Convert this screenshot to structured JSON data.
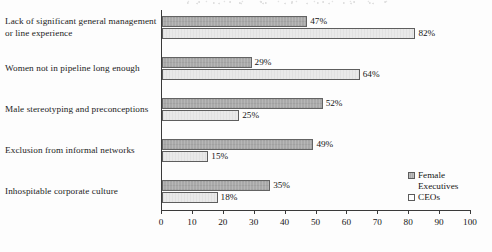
{
  "chart_data": {
    "type": "bar",
    "orientation": "horizontal",
    "title": "",
    "xlabel": "",
    "ylabel": "",
    "xlim": [
      0,
      100
    ],
    "xticks": [
      0,
      10,
      20,
      30,
      40,
      50,
      60,
      70,
      80,
      90,
      100
    ],
    "grid": false,
    "legend_position": "bottom-right",
    "value_suffix": "%",
    "categories": [
      "Lack of significant general management or line experience",
      "Women not in pipeline long enough",
      "Male stereotyping and preconceptions",
      "Exclusion from informal networks",
      "Inhospitable corporate culture"
    ],
    "series": [
      {
        "name": "Female Executives",
        "color": "#a9a9a9",
        "values": [
          47,
          29,
          52,
          49,
          35
        ],
        "labels": [
          "47%",
          "29%",
          "52%",
          "49%",
          "35%"
        ]
      },
      {
        "name": "CEOs",
        "color": "#e9e9e9",
        "values": [
          82,
          64,
          25,
          15,
          18
        ],
        "labels": [
          "82%",
          "64%",
          "25%",
          "15%",
          "18%"
        ]
      }
    ]
  },
  "axis": {
    "tick_labels": [
      "0",
      "10",
      "20",
      "30",
      "40",
      "50",
      "60",
      "70",
      "80",
      "90",
      "100"
    ]
  },
  "category_labels": [
    {
      "line1": "Lack of significant general management",
      "line2": "or line experience"
    },
    {
      "line1": "Women not in pipeline long enough",
      "line2": ""
    },
    {
      "line1": "Male stereotyping and preconceptions",
      "line2": ""
    },
    {
      "line1": "Exclusion from informal networks",
      "line2": ""
    },
    {
      "line1": "Inhospitable corporate culture",
      "line2": ""
    }
  ],
  "legend": {
    "items": [
      {
        "label_line1": "Female",
        "label_line2": "Executives"
      },
      {
        "label_line1": "CEOs",
        "label_line2": ""
      }
    ]
  }
}
